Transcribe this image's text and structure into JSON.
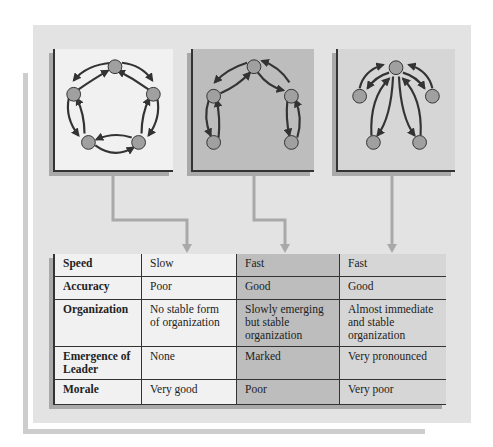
{
  "colors": {
    "background_panel": "#e3e3e3",
    "panel_circle": "#f1f1f1",
    "panel_chain": "#bdbdbd",
    "panel_wheel": "#d6d6d6",
    "node_fill": "#a0a0a0",
    "edge_color": "#333333",
    "connector_color": "#a9a9a9"
  },
  "networks": [
    {
      "id": "circle",
      "nodes": 5,
      "layout": "pentagon ring, bidirectional arrows between adjacent nodes"
    },
    {
      "id": "chain",
      "nodes": 5,
      "layout": "arch chain, bidirectional arrows between sequential nodes"
    },
    {
      "id": "wheel",
      "nodes": 5,
      "layout": "hub at top, bidirectional arrows to 4 peripheral nodes"
    }
  ],
  "table": {
    "rows": [
      {
        "label": "Speed",
        "values": [
          "Slow",
          "Fast",
          "Fast"
        ]
      },
      {
        "label": "Accuracy",
        "values": [
          "Poor",
          "Good",
          "Good"
        ]
      },
      {
        "label": "Organization",
        "values": [
          "No stable form of organization",
          "Slowly emerging but stable organization",
          "Almost immediate and stable organization"
        ]
      },
      {
        "label": "Emergence of Leader",
        "values": [
          "None",
          "Marked",
          "Very pronounced"
        ]
      },
      {
        "label": "Morale",
        "values": [
          "Very good",
          "Poor",
          "Very poor"
        ]
      }
    ]
  }
}
